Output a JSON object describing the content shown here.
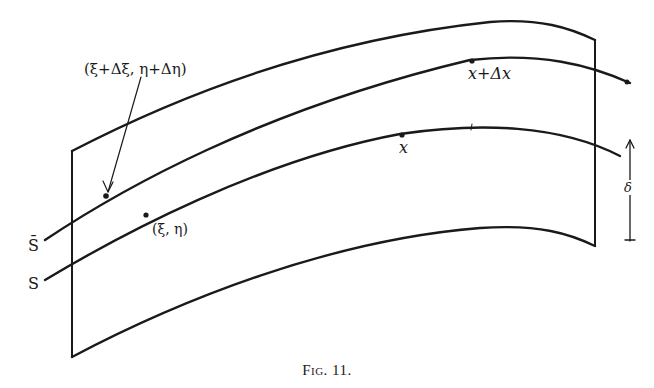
{
  "figure": {
    "caption": "Fig. 11.",
    "labels": {
      "shifted_point": "(ξ+Δξ, η+Δη)",
      "point": "(ξ, η)",
      "x": "x",
      "x_plus_dx": "x+Δx",
      "s_bar": "S̄",
      "s": "S",
      "delta": "δ"
    },
    "colors": {
      "ink": "#1a1a1a",
      "background": "#ffffff"
    }
  }
}
